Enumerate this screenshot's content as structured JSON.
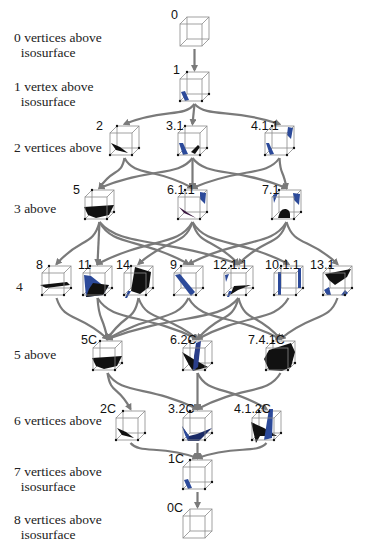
{
  "diagram": {
    "row_labels": [
      {
        "id": "r0",
        "text": "0 vertices above\n  isosurface",
        "x": 14,
        "y": 30
      },
      {
        "id": "r1",
        "text": "1 vertex above\n  isosurface",
        "x": 14,
        "y": 79
      },
      {
        "id": "r2",
        "text": "2 vertices above",
        "x": 14,
        "y": 140
      },
      {
        "id": "r3",
        "text": "3 above",
        "x": 14,
        "y": 201
      },
      {
        "id": "r4",
        "text": "4",
        "x": 16,
        "y": 279
      },
      {
        "id": "r5",
        "text": "5 above",
        "x": 14,
        "y": 347
      },
      {
        "id": "r6",
        "text": "6 vertices above",
        "x": 14,
        "y": 413
      },
      {
        "id": "r7",
        "text": "7 vertices above\n  isosurface",
        "x": 14,
        "y": 464
      },
      {
        "id": "r8",
        "text": "8 vertices above\n  isosurface",
        "x": 14,
        "y": 512
      }
    ],
    "nodes": [
      {
        "id": "0",
        "label": "0",
        "x": 180,
        "y": 24,
        "lx": 171,
        "ly": 8,
        "surface": "none"
      },
      {
        "id": "1",
        "label": "1",
        "x": 180,
        "y": 79,
        "lx": 173,
        "ly": 63,
        "surface": "corner"
      },
      {
        "id": "2",
        "label": "2",
        "x": 110,
        "y": 133,
        "lx": 96,
        "ly": 119,
        "surface": "edge"
      },
      {
        "id": "3.1",
        "label": "3.1",
        "x": 178,
        "y": 133,
        "lx": 166,
        "ly": 119,
        "surface": "two-corners"
      },
      {
        "id": "4.1.1",
        "label": "4.1.1",
        "x": 265,
        "y": 133,
        "lx": 251,
        "ly": 119,
        "surface": "diag-corners"
      },
      {
        "id": "5",
        "label": "5",
        "x": 85,
        "y": 197,
        "lx": 73,
        "ly": 183,
        "surface": "trough"
      },
      {
        "id": "6.1.1",
        "label": "6.1.1",
        "x": 178,
        "y": 197,
        "lx": 167,
        "ly": 183,
        "surface": "edge-corner"
      },
      {
        "id": "7.1",
        "label": "7.1",
        "x": 272,
        "y": 197,
        "lx": 262,
        "ly": 183,
        "surface": "three-corners"
      },
      {
        "id": "8",
        "label": "8",
        "x": 42,
        "y": 273,
        "lx": 36,
        "ly": 258,
        "surface": "plane"
      },
      {
        "id": "11",
        "label": "11",
        "x": 83,
        "y": 273,
        "lx": 78,
        "ly": 258,
        "surface": "hexagon"
      },
      {
        "id": "14",
        "label": "14",
        "x": 124,
        "y": 273,
        "lx": 116,
        "ly": 258,
        "surface": "hexagon-b"
      },
      {
        "id": "9",
        "label": "9",
        "x": 174,
        "y": 273,
        "lx": 170,
        "ly": 258,
        "surface": "diag-strip"
      },
      {
        "id": "12.1.1",
        "label": "12.1.1",
        "x": 224,
        "y": 273,
        "lx": 213,
        "ly": 258,
        "surface": "edge-corners"
      },
      {
        "id": "10.1.1",
        "label": "10.1.1",
        "x": 274,
        "y": 273,
        "lx": 265,
        "ly": 258,
        "surface": "two-strips"
      },
      {
        "id": "13.1",
        "label": "13.1",
        "x": 323,
        "y": 273,
        "lx": 310,
        "ly": 258,
        "surface": "complex"
      },
      {
        "id": "5C",
        "label": "5C",
        "x": 93,
        "y": 348,
        "lx": 81,
        "ly": 333,
        "surface": "trough"
      },
      {
        "id": "6.2C",
        "label": "6.2C",
        "x": 183,
        "y": 348,
        "lx": 170,
        "ly": 333,
        "surface": "saddle"
      },
      {
        "id": "7.4.1C",
        "label": "7.4.1C",
        "x": 266,
        "y": 348,
        "lx": 248,
        "ly": 333,
        "surface": "filled"
      },
      {
        "id": "2C",
        "label": "2C",
        "x": 116,
        "y": 418,
        "lx": 100,
        "ly": 402,
        "surface": "edge"
      },
      {
        "id": "3.2C",
        "label": "3.2C",
        "x": 183,
        "y": 418,
        "lx": 168,
        "ly": 402,
        "surface": "valley"
      },
      {
        "id": "4.1.2C",
        "label": "4.1.2C",
        "x": 252,
        "y": 418,
        "lx": 234,
        "ly": 402,
        "surface": "twisted"
      },
      {
        "id": "1C",
        "label": "1C",
        "x": 183,
        "y": 467,
        "lx": 168,
        "ly": 452,
        "surface": "corner"
      },
      {
        "id": "0C",
        "label": "0C",
        "x": 183,
        "y": 516,
        "lx": 167,
        "ly": 501,
        "surface": "none"
      }
    ],
    "edges": [
      [
        "0",
        "1"
      ],
      [
        "1",
        "2"
      ],
      [
        "1",
        "3.1"
      ],
      [
        "1",
        "4.1.1"
      ],
      [
        "2",
        "5"
      ],
      [
        "2",
        "6.1.1"
      ],
      [
        "3.1",
        "5"
      ],
      [
        "3.1",
        "6.1.1"
      ],
      [
        "3.1",
        "7.1"
      ],
      [
        "4.1.1",
        "6.1.1"
      ],
      [
        "4.1.1",
        "7.1"
      ],
      [
        "5",
        "8"
      ],
      [
        "5",
        "11"
      ],
      [
        "5",
        "9"
      ],
      [
        "5",
        "12.1.1"
      ],
      [
        "6.1.1",
        "11"
      ],
      [
        "6.1.1",
        "14"
      ],
      [
        "6.1.1",
        "12.1.1"
      ],
      [
        "6.1.1",
        "10.1.1"
      ],
      [
        "7.1",
        "9"
      ],
      [
        "7.1",
        "12.1.1"
      ],
      [
        "7.1",
        "13.1"
      ],
      [
        "8",
        "5C"
      ],
      [
        "11",
        "5C"
      ],
      [
        "14",
        "6.2C"
      ],
      [
        "9",
        "5C"
      ],
      [
        "9",
        "7.4.1C"
      ],
      [
        "12.1.1",
        "5C"
      ],
      [
        "12.1.1",
        "6.2C"
      ],
      [
        "12.1.1",
        "7.4.1C"
      ],
      [
        "10.1.1",
        "6.2C"
      ],
      [
        "13.1",
        "7.4.1C"
      ],
      [
        "14",
        "5C"
      ],
      [
        "11",
        "6.2C"
      ],
      [
        "5C",
        "2C"
      ],
      [
        "5C",
        "3.2C"
      ],
      [
        "6.2C",
        "3.2C"
      ],
      [
        "6.2C",
        "4.1.2C"
      ],
      [
        "7.4.1C",
        "3.2C"
      ],
      [
        "2C",
        "1C"
      ],
      [
        "3.2C",
        "1C"
      ],
      [
        "4.1.2C",
        "1C"
      ],
      [
        "1C",
        "0C"
      ]
    ],
    "colors": {
      "cube_edge": "#8a8a8a",
      "arrow": "#7a7a7a",
      "surface_dark": "#111111",
      "surface_blue": "#2c4a9a",
      "vertex_dot": "#111111"
    }
  }
}
